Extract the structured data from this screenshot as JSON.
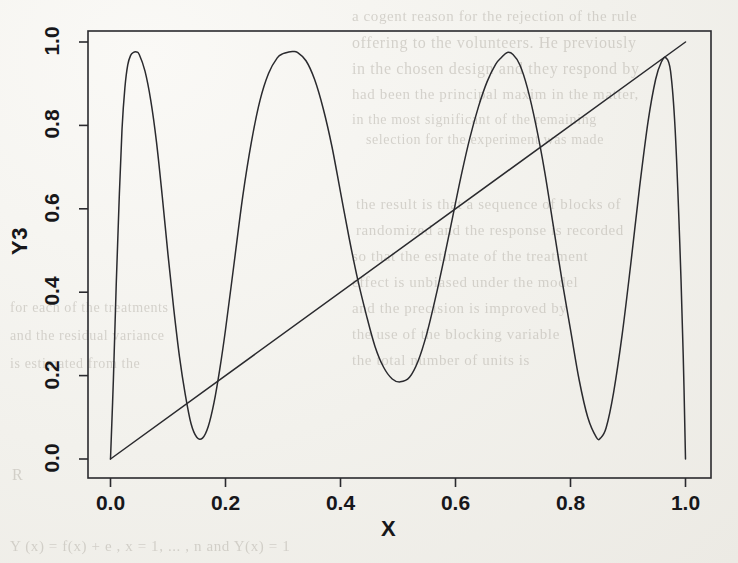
{
  "figure": {
    "background_color": "#f2f1ec",
    "ink_color": "#2a2a2e",
    "axis_label_color": "#17171a",
    "page_note": "scanned journal page with faint bleed-through text behind the figure"
  },
  "axes": {
    "x_title": "X",
    "y_title": "Y3",
    "x_ticks": [
      "0.0",
      "0.2",
      "0.4",
      "0.6",
      "0.8",
      "1.0"
    ],
    "y_ticks": [
      "0.0",
      "0.2",
      "0.4",
      "0.6",
      "0.8",
      "1.0"
    ]
  },
  "bleed_text": {
    "lines": [
      {
        "text": "a cogent reason for the rejection of the rule",
        "x": 352,
        "y": 8,
        "size": 15
      },
      {
        "text": "offering to the volunteers. He previously",
        "x": 352,
        "y": 34,
        "size": 16
      },
      {
        "text": "in the chosen design and they respond by",
        "x": 352,
        "y": 60,
        "size": 16
      },
      {
        "text": "had been the principal maxim in the matter,",
        "x": 352,
        "y": 86,
        "size": 15
      },
      {
        "text": "in the most significant of the remaining",
        "x": 352,
        "y": 112,
        "size": 14
      },
      {
        "text": "selection for the experiment was made",
        "x": 366,
        "y": 132,
        "size": 14
      },
      {
        "text": "the result is that a sequence of blocks of",
        "x": 356,
        "y": 196,
        "size": 15
      },
      {
        "text": "randomized and the response is recorded",
        "x": 356,
        "y": 222,
        "size": 15
      },
      {
        "text": "so that the estimate of the treatment",
        "x": 352,
        "y": 248,
        "size": 15
      },
      {
        "text": "effect is unbiased under the model",
        "x": 352,
        "y": 274,
        "size": 15
      },
      {
        "text": "and the precision is improved by",
        "x": 352,
        "y": 300,
        "size": 15
      },
      {
        "text": "the use of the blocking variable",
        "x": 352,
        "y": 326,
        "size": 15
      },
      {
        "text": "the total number of units is",
        "x": 352,
        "y": 352,
        "size": 15
      },
      {
        "text": "for each of the treatments",
        "x": 10,
        "y": 300,
        "size": 14
      },
      {
        "text": "and the residual variance",
        "x": 10,
        "y": 328,
        "size": 14
      },
      {
        "text": "is estimated from the",
        "x": 10,
        "y": 356,
        "size": 14
      },
      {
        "text": "R",
        "x": 12,
        "y": 466,
        "size": 16
      },
      {
        "text": "Y (x) = f(x) + e ,   x = 1, ... , n   and   Y(x) = 1",
        "x": 10,
        "y": 538,
        "size": 15
      }
    ]
  },
  "chart_data": {
    "type": "line",
    "title": "",
    "xlabel": "X",
    "ylabel": "Y3",
    "xlim": [
      0.0,
      1.0
    ],
    "ylim": [
      0.0,
      1.0
    ],
    "grid": false,
    "legend": "none",
    "frame": "box",
    "series": [
      {
        "name": "oscillating chirp curve",
        "description": "smooth oscillation whose frequency increases with x; starts at (0,0), four peaks near 0.975 and valleys dropping from 0.05 to 0.185 and back to 0.05, ending with a sharp drop to 0 at x=1.0",
        "x": [
          0.0,
          0.005,
          0.01,
          0.015,
          0.02,
          0.025,
          0.03,
          0.035,
          0.04,
          0.045,
          0.05,
          0.06,
          0.07,
          0.08,
          0.09,
          0.1,
          0.11,
          0.12,
          0.13,
          0.14,
          0.15,
          0.16,
          0.17,
          0.18,
          0.19,
          0.2,
          0.215,
          0.23,
          0.245,
          0.26,
          0.275,
          0.29,
          0.3,
          0.31,
          0.317,
          0.325,
          0.34,
          0.355,
          0.37,
          0.385,
          0.4,
          0.415,
          0.43,
          0.445,
          0.46,
          0.475,
          0.49,
          0.504,
          0.52,
          0.535,
          0.55,
          0.565,
          0.58,
          0.595,
          0.61,
          0.625,
          0.64,
          0.655,
          0.67,
          0.68,
          0.69,
          0.7,
          0.712,
          0.725,
          0.74,
          0.755,
          0.77,
          0.785,
          0.8,
          0.815,
          0.83,
          0.845,
          0.852,
          0.862,
          0.875,
          0.89,
          0.905,
          0.92,
          0.935,
          0.948,
          0.958,
          0.966,
          0.974,
          0.982,
          0.99,
          0.996,
          1.0
        ],
        "y": [
          0.0,
          0.19,
          0.42,
          0.62,
          0.79,
          0.89,
          0.945,
          0.968,
          0.975,
          0.976,
          0.97,
          0.93,
          0.86,
          0.76,
          0.63,
          0.49,
          0.36,
          0.245,
          0.155,
          0.085,
          0.052,
          0.05,
          0.078,
          0.135,
          0.215,
          0.31,
          0.47,
          0.63,
          0.76,
          0.86,
          0.925,
          0.962,
          0.972,
          0.976,
          0.977,
          0.975,
          0.955,
          0.91,
          0.84,
          0.75,
          0.64,
          0.53,
          0.43,
          0.345,
          0.27,
          0.22,
          0.192,
          0.185,
          0.196,
          0.235,
          0.3,
          0.385,
          0.48,
          0.58,
          0.68,
          0.77,
          0.845,
          0.905,
          0.947,
          0.963,
          0.975,
          0.97,
          0.945,
          0.89,
          0.8,
          0.69,
          0.56,
          0.43,
          0.31,
          0.19,
          0.1,
          0.052,
          0.05,
          0.075,
          0.16,
          0.3,
          0.47,
          0.65,
          0.81,
          0.91,
          0.952,
          0.962,
          0.93,
          0.79,
          0.52,
          0.25,
          0.0
        ]
      },
      {
        "name": "identity line",
        "description": "straight diagonal line y = x from (0,0) to (1,1)",
        "x": [
          0.0,
          1.0
        ],
        "y": [
          0.0,
          1.0
        ]
      }
    ]
  }
}
